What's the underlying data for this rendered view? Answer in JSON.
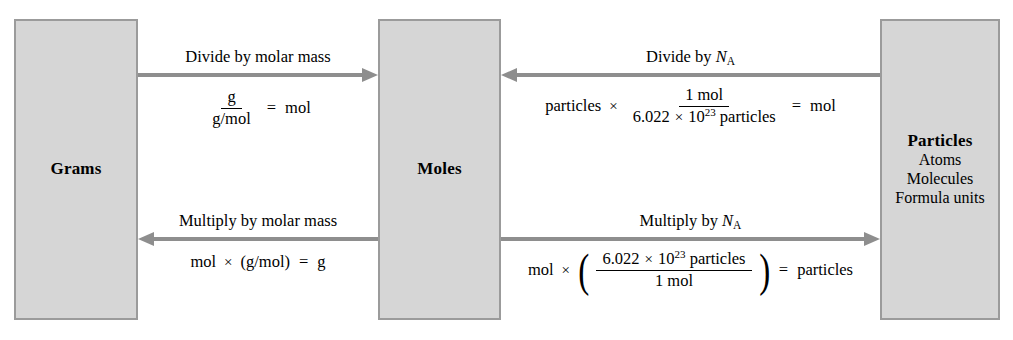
{
  "diagram": {
    "colors": {
      "box_fill": "#d6d6d6",
      "box_border": "#9b9b9b",
      "arrow": "#8e8e8e",
      "text": "#000000",
      "background": "#ffffff"
    },
    "nodes": [
      {
        "id": "grams",
        "title": "Grams",
        "subitems": []
      },
      {
        "id": "moles",
        "title": "Moles",
        "subitems": []
      },
      {
        "id": "particles",
        "title": "Particles",
        "subitems": [
          "Atoms",
          "Molecules",
          "Formula units"
        ]
      }
    ],
    "arrows": [
      {
        "id": "grams-to-moles",
        "from": "Grams",
        "to": "Moles",
        "direction": "right",
        "label_prefix": "Divide by ",
        "label_symbol": "molar mass",
        "label_full": "Divide by molar mass",
        "equation_text": "g / (g/mol) = mol"
      },
      {
        "id": "moles-to-grams",
        "from": "Moles",
        "to": "Grams",
        "direction": "left",
        "label_prefix": "Multiply by ",
        "label_symbol": "molar mass",
        "label_full": "Multiply by molar mass",
        "equation_text": "mol × (g/mol) = g"
      },
      {
        "id": "particles-to-moles",
        "from": "Particles",
        "to": "Moles",
        "direction": "left",
        "label_prefix": "Divide by ",
        "label_symbol": "N",
        "label_subscript": "A",
        "label_full": "Divide by NA",
        "equation_text": "particles × (1 mol / 6.022 × 10^23 particles) = mol"
      },
      {
        "id": "moles-to-particles",
        "from": "Moles",
        "to": "Particles",
        "direction": "right",
        "label_prefix": "Multiply by ",
        "label_symbol": "N",
        "label_subscript": "A",
        "label_full": "Multiply by NA",
        "equation_text": "mol × (6.022 × 10^23 particles / 1 mol) = particles"
      }
    ],
    "equations": {
      "grams_to_moles": {
        "numerator": "g",
        "denominator": "g/mol",
        "equals": "=",
        "result": "mol"
      },
      "moles_to_grams": {
        "left": "mol",
        "times": "×",
        "factor": "(g/mol)",
        "equals": "=",
        "result": "g"
      },
      "particles_to_moles": {
        "left": "particles",
        "times": "×",
        "numerator": "1 mol",
        "den_coefficient": "6.022",
        "den_times": "×",
        "den_base": "10",
        "den_exponent": "23",
        "den_unit": "particles",
        "equals": "=",
        "result": "mol"
      },
      "moles_to_particles": {
        "left": "mol",
        "times": "×",
        "num_coefficient": "6.022",
        "num_times": "×",
        "num_base": "10",
        "num_exponent": "23",
        "num_unit": "particles",
        "denominator": "1 mol",
        "equals": "=",
        "result": "particles"
      }
    }
  }
}
